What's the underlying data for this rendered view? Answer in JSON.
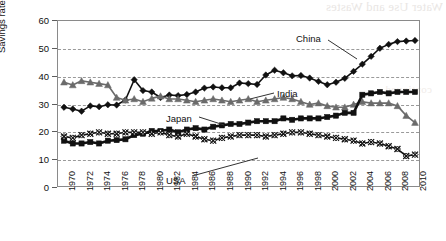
{
  "chart_data": {
    "type": "line",
    "title": "",
    "xlabel": "",
    "ylabel": "Savings rate (%)",
    "ylim": [
      0,
      60
    ],
    "xlim": [
      1970,
      2011
    ],
    "ytick_values": [
      0,
      10,
      20,
      30,
      40,
      50,
      60
    ],
    "xtick_labels": [
      "1970",
      "1972",
      "1974",
      "1976",
      "1978",
      "1980",
      "1982",
      "1984",
      "1986",
      "1988",
      "1990",
      "1992",
      "1994",
      "1996",
      "1998",
      "2000",
      "2002",
      "2004",
      "2006",
      "2008",
      "2010"
    ],
    "grid": "horizontal-dashed",
    "legend": "inline-annotations",
    "x": [
      1970,
      1971,
      1972,
      1973,
      1974,
      1975,
      1976,
      1977,
      1978,
      1979,
      1980,
      1981,
      1982,
      1983,
      1984,
      1985,
      1986,
      1987,
      1988,
      1989,
      1990,
      1991,
      1992,
      1993,
      1994,
      1995,
      1996,
      1997,
      1998,
      1999,
      2000,
      2001,
      2002,
      2003,
      2004,
      2005,
      2006,
      2007,
      2008,
      2009,
      2010
    ],
    "series": [
      {
        "name": "China",
        "marker": "filled-diamond",
        "color": "#111111",
        "values": [
          29.0,
          28.4,
          27.6,
          29.5,
          29.2,
          29.9,
          29.8,
          31.6,
          38.9,
          35.0,
          34.5,
          32.5,
          33.4,
          33.2,
          33.6,
          34.5,
          35.9,
          36.3,
          36.0,
          36.0,
          37.7,
          37.5,
          37.2,
          40.6,
          42.3,
          41.4,
          40.3,
          40.4,
          39.5,
          38.3,
          37.1,
          38.0,
          39.4,
          41.9,
          44.5,
          47.3,
          50.2,
          51.6,
          52.6,
          52.8,
          53.0
        ]
      },
      {
        "name": "India",
        "marker": "filled-triangle",
        "color": "#6b6b6b",
        "values": [
          38.0,
          37.0,
          38.5,
          38.0,
          37.5,
          37.0,
          32.5,
          31.5,
          32.0,
          31.0,
          32.2,
          33.0,
          32.0,
          32.0,
          31.5,
          31.0,
          31.5,
          32.0,
          31.5,
          31.0,
          31.5,
          32.0,
          31.0,
          31.5,
          32.0,
          32.5,
          32.0,
          31.0,
          30.0,
          30.5,
          29.5,
          29.0,
          29.0,
          30.0,
          31.0,
          30.5,
          30.5,
          30.5,
          29.5,
          26.0,
          23.5
        ]
      },
      {
        "name": "Japan",
        "marker": "filled-square",
        "color": "#111111",
        "values": [
          17.0,
          16.0,
          16.0,
          16.5,
          16.0,
          17.0,
          17.2,
          17.5,
          19.0,
          19.5,
          20.5,
          20.5,
          21.0,
          20.0,
          21.0,
          21.5,
          21.0,
          22.0,
          22.5,
          23.0,
          23.0,
          23.5,
          24.0,
          24.0,
          24.0,
          25.0,
          24.5,
          25.0,
          25.0,
          25.0,
          25.5,
          26.0,
          27.0,
          27.0,
          33.5,
          34.0,
          34.5,
          34.0,
          34.5,
          34.5,
          34.5
        ]
      },
      {
        "name": "USA",
        "marker": "open-diamond-cross",
        "color": "#111111",
        "values": [
          18.5,
          18.0,
          19.0,
          19.5,
          20.0,
          19.5,
          19.5,
          20.0,
          20.0,
          20.0,
          19.5,
          20.0,
          19.0,
          18.5,
          19.5,
          18.5,
          17.5,
          17.0,
          18.0,
          18.5,
          19.0,
          19.0,
          19.0,
          18.5,
          19.0,
          19.5,
          20.0,
          20.0,
          19.5,
          19.0,
          18.5,
          18.0,
          17.5,
          17.0,
          16.0,
          16.5,
          16.0,
          15.0,
          14.0,
          11.5,
          12.0
        ]
      }
    ],
    "annotations": [
      {
        "text": "China",
        "x_px": 296,
        "y_px": 33
      },
      {
        "text": "India",
        "x_px": 277,
        "y_px": 88
      },
      {
        "text": "Japan",
        "x_px": 166,
        "y_px": 113
      },
      {
        "text": "USA",
        "x_px": 166,
        "y_px": 175
      }
    ]
  },
  "background_bleed": {
    "line1": "Water Use and Wastes",
    "line2": "continued"
  }
}
